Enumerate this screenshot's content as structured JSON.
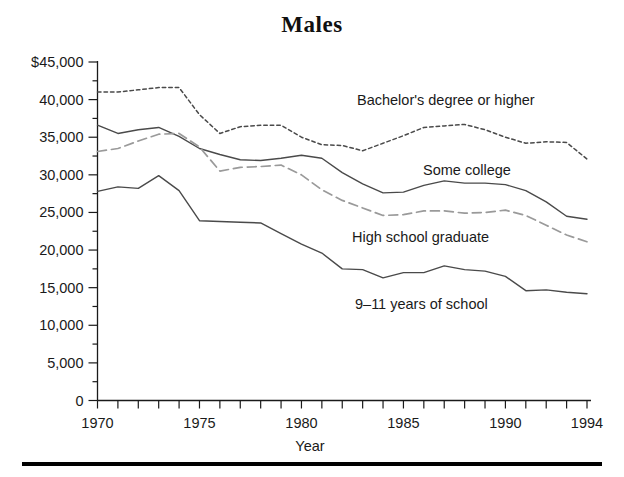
{
  "title": "Males",
  "axes": {
    "x_title": "Year",
    "x_ticks": [
      "1970",
      "1975",
      "1980",
      "1985",
      "1990",
      "1994"
    ],
    "y_ticks": [
      "$45,000",
      "40,000",
      "35,000",
      "30,000",
      "25,000",
      "20,000",
      "15,000",
      "10,000",
      "5,000",
      "0"
    ]
  },
  "series_labels": {
    "bachelors": "Bachelor's degree or higher",
    "some_college": "Some college",
    "high_school": "High school graduate",
    "nine_eleven": "9–11 years of school"
  },
  "colors": {
    "ink": "#1a1a1a",
    "line_dark": "#4a4a4a",
    "line_light": "#9a9a9a",
    "rule": "#000000"
  },
  "chart_data": {
    "type": "line",
    "title": "Males",
    "xlabel": "Year",
    "ylabel": "",
    "xlim": [
      1970,
      1994
    ],
    "ylim": [
      0,
      45000
    ],
    "y_tick_step": 5000,
    "y_minor_tick_step": 2500,
    "x_tick_step": 1,
    "grid": false,
    "legend": "inline-annotations",
    "x": [
      1970,
      1971,
      1972,
      1973,
      1974,
      1975,
      1976,
      1977,
      1978,
      1979,
      1980,
      1981,
      1982,
      1983,
      1984,
      1985,
      1986,
      1987,
      1988,
      1989,
      1990,
      1991,
      1992,
      1993,
      1994
    ],
    "series": [
      {
        "name": "Bachelor's degree or higher",
        "style": "dotted",
        "values": [
          41000,
          41000,
          41300,
          41600,
          41600,
          38000,
          35500,
          36400,
          36600,
          36600,
          35000,
          34000,
          33900,
          33200,
          34200,
          35200,
          36300,
          36500,
          36700,
          36000,
          35000,
          34200,
          34400,
          34300,
          32100
        ]
      },
      {
        "name": "Some college",
        "style": "solid",
        "values": [
          36600,
          35500,
          36000,
          36300,
          35100,
          33500,
          32700,
          32000,
          31900,
          32200,
          32600,
          32200,
          30300,
          28800,
          27600,
          27700,
          28600,
          29200,
          28900,
          28900,
          28700,
          27900,
          26400,
          24500,
          24100
        ]
      },
      {
        "name": "High school graduate",
        "style": "dashed",
        "values": [
          33100,
          33500,
          34500,
          35400,
          35500,
          33700,
          30500,
          31000,
          31100,
          31300,
          30000,
          28000,
          26600,
          25600,
          24600,
          24700,
          25200,
          25200,
          24900,
          25000,
          25300,
          24600,
          23300,
          22000,
          21100
        ]
      },
      {
        "name": "9–11 years of school",
        "style": "solid",
        "values": [
          27800,
          28400,
          28200,
          29900,
          27900,
          23900,
          23800,
          23700,
          23600,
          22200,
          20800,
          19600,
          17500,
          17400,
          16300,
          17000,
          17000,
          17900,
          17400,
          17200,
          16500,
          14600,
          14700,
          14400,
          14200
        ]
      }
    ]
  }
}
